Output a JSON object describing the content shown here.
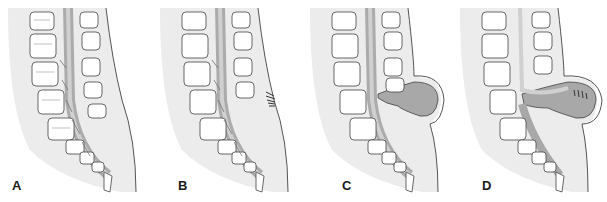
{
  "figure": {
    "panels": [
      {
        "id": "A",
        "label": "A",
        "variant": "normal"
      },
      {
        "id": "B",
        "label": "B",
        "variant": "hair-tuft"
      },
      {
        "id": "C",
        "label": "C",
        "variant": "sac"
      },
      {
        "id": "D",
        "label": "D",
        "variant": "sac-with-nerves"
      }
    ],
    "colors": {
      "body_fill": "#ececec",
      "skin_line": "#555555",
      "bone_fill": "#ffffff",
      "bone_texture": "#8a8a8a",
      "canal_fill": "#9e9e9e",
      "cord_fill": "#d0d0d0",
      "sac_fill": "#a8a8a8",
      "label": "#1a1a1a"
    }
  }
}
